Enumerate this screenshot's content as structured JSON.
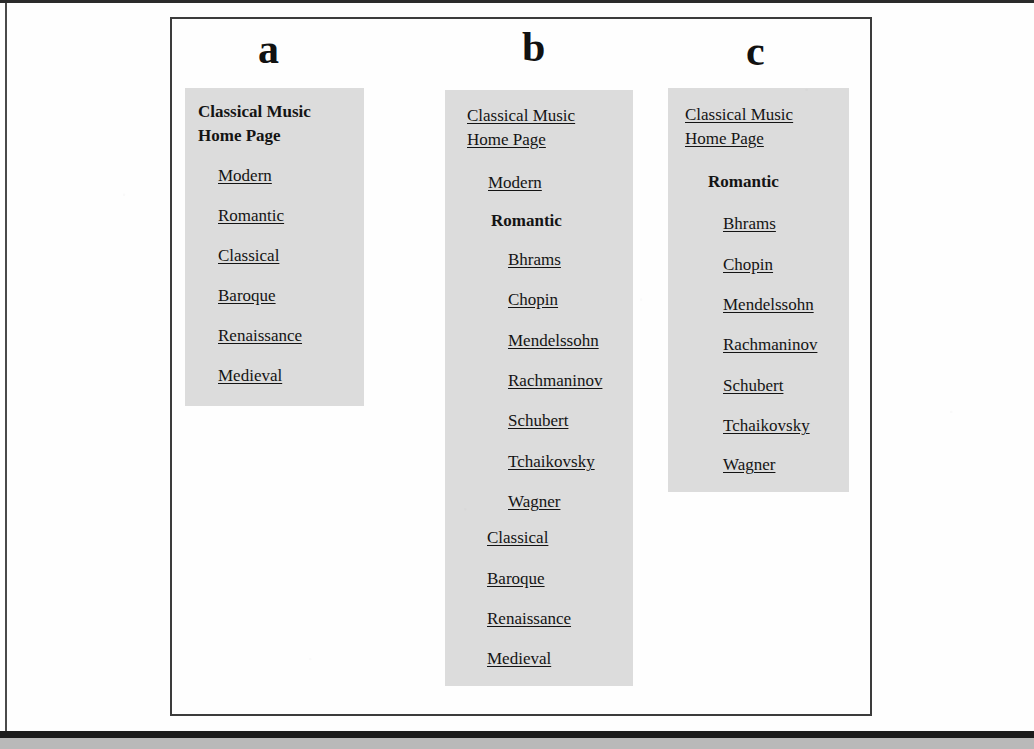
{
  "figure": {
    "panels": [
      {
        "label": "a",
        "home_link": "Classical Music Home Page",
        "home_is_link": false,
        "items": [
          {
            "text": "Modern",
            "style": "link"
          },
          {
            "text": "Romantic",
            "style": "link"
          },
          {
            "text": "Classical",
            "style": "link"
          },
          {
            "text": "Baroque",
            "style": "link"
          },
          {
            "text": "Renaissance",
            "style": "link"
          },
          {
            "text": "Medieval",
            "style": "link"
          }
        ]
      },
      {
        "label": "b",
        "home_link": "Classical Music Home Page",
        "home_is_link": true,
        "items": [
          {
            "text": "Modern",
            "style": "link"
          },
          {
            "text": "Romantic",
            "style": "current"
          },
          {
            "text": "Bhrams",
            "style": "link"
          },
          {
            "text": "Chopin",
            "style": "link"
          },
          {
            "text": "Mendelssohn",
            "style": "link"
          },
          {
            "text": "Rachmaninov",
            "style": "link"
          },
          {
            "text": "Schubert",
            "style": "link"
          },
          {
            "text": "Tchaikovsky",
            "style": "link"
          },
          {
            "text": "Wagner",
            "style": "link"
          },
          {
            "text": "Classical",
            "style": "link"
          },
          {
            "text": "Baroque",
            "style": "link"
          },
          {
            "text": "Renaissance",
            "style": "link"
          },
          {
            "text": "Medieval",
            "style": "link"
          }
        ]
      },
      {
        "label": "c",
        "home_link": "Classical Music Home Page",
        "home_is_link": true,
        "items": [
          {
            "text": "Romantic",
            "style": "current"
          },
          {
            "text": "Bhrams",
            "style": "link"
          },
          {
            "text": "Chopin",
            "style": "link"
          },
          {
            "text": "Mendelssohn",
            "style": "link"
          },
          {
            "text": "Rachmaninov",
            "style": "link"
          },
          {
            "text": "Schubert",
            "style": "link"
          },
          {
            "text": "Tchaikovsky",
            "style": "link"
          },
          {
            "text": "Wagner",
            "style": "link"
          }
        ]
      }
    ]
  },
  "colors": {
    "panel_background": "#dcdcdc",
    "page_background": "#ffffff",
    "frame_border": "#3c3c3c",
    "text": "#141414"
  }
}
